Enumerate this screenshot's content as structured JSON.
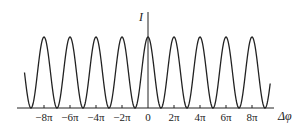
{
  "chart_data": {
    "type": "line",
    "title": "",
    "xlabel": "Δφ",
    "ylabel": "I",
    "function": "I = I0 (1 + cos Δφ)",
    "x_range_pi": [
      -9.5,
      9.4
    ],
    "x_ticks_pi": [
      -8,
      -6,
      -4,
      -2,
      0,
      2,
      4,
      6,
      8
    ],
    "x_tick_labels": [
      "−8π",
      "−6π",
      "−4π",
      "−2π",
      "0",
      "2π",
      "4π",
      "6π",
      "8π"
    ],
    "y_ticks": [],
    "peaks_at_pi": [
      -8,
      -6,
      -4,
      -2,
      0,
      2,
      4,
      6,
      8
    ],
    "minima_at_pi": [
      -9,
      -7,
      -5,
      -3,
      -1,
      1,
      3,
      5,
      7,
      9
    ],
    "peak_value": 1,
    "min_value": 0,
    "grid": false,
    "legend": null,
    "line_color": "#222222"
  },
  "axes": {
    "x_label": "Δφ",
    "y_label": "I"
  }
}
